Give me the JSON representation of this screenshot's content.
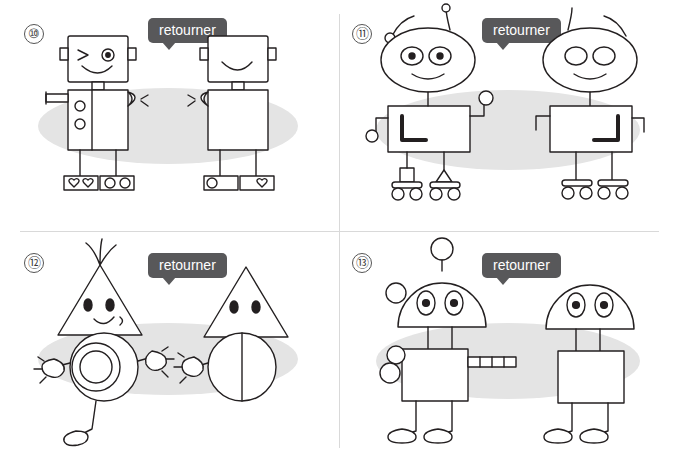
{
  "page": {
    "background": "#ffffff",
    "shadow_color": "#e3e3e3",
    "stroke_color": "#231f20",
    "callout_bg": "#58585a",
    "callout_text_color": "#ffffff"
  },
  "panels": [
    {
      "number": "⑩",
      "callout": "retourner",
      "subject": "robot-square-head",
      "description": "Robot carré avec tête carrée, œil clin d'œil, bouche souriante, corps rectangulaire avec deux boutons, bras, pieds avec cœurs et cercles",
      "left_figure": "modèle complet",
      "right_figure": "figure retournée incomplète"
    },
    {
      "number": "⑪",
      "callout": "retourner",
      "subject": "robot-antennae",
      "description": "Robot avec antennes, tête ovale, deux yeux, corps rectangulaire avec forme en L, bras, roues",
      "left_figure": "modèle complet",
      "right_figure": "figure retournée incomplète"
    },
    {
      "number": "⑫",
      "callout": "retourner",
      "subject": "robot-triangle-head",
      "description": "Robot à tête triangulaire avec cheveux, deux yeux, sourire, corps circulaire avec spirale, bras et jambe",
      "left_figure": "modèle complet",
      "right_figure": "figure retournée incomplète"
    },
    {
      "number": "⑬",
      "callout": "retourner",
      "subject": "robot-dome-head",
      "description": "Robot à tête en dôme avec antenne boule, deux yeux ovales, corps carré, bras tuyau, jambes",
      "left_figure": "modèle complet",
      "right_figure": "figure retournée incomplète"
    }
  ]
}
